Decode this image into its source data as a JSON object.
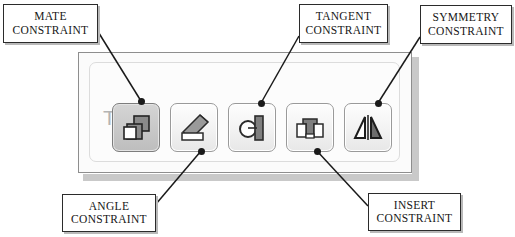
{
  "figure": {
    "title_hidden": "",
    "annotation_boxes": [
      {
        "id": "mate",
        "line1": "MATE",
        "line2": "CONSTRAINT"
      },
      {
        "id": "tangent",
        "line1": "TANGENT",
        "line2": "CONSTRAINT"
      },
      {
        "id": "symmetry",
        "line1": "SYMMETRY",
        "line2": "CONSTRAINT"
      },
      {
        "id": "angle",
        "line1": "ANGLE",
        "line2": "CONSTRAINT"
      },
      {
        "id": "insert",
        "line1": "INSERT",
        "line2": "CONSTRAINT"
      }
    ]
  },
  "panel": {
    "group_title": "Type",
    "buttons": [
      {
        "icon": "mate-constraint-icon",
        "label": "Mate",
        "selected": true
      },
      {
        "icon": "angle-constraint-icon",
        "label": "Angle",
        "selected": false
      },
      {
        "icon": "tangent-constraint-icon",
        "label": "Tangent",
        "selected": false
      },
      {
        "icon": "insert-constraint-icon",
        "label": "Insert",
        "selected": false
      },
      {
        "icon": "symmetry-constraint-icon",
        "label": "Symmetry",
        "selected": false
      }
    ]
  },
  "colors": {
    "panel_background": "#fbfbfb",
    "panel_border": "#8e8e8e",
    "group_border": "#dcdcdc",
    "group_title": "#b4b4b4",
    "button_face": "#f3f3f3",
    "button_selected_face": "#c9c9c9",
    "button_border": "#9a9a9a",
    "callout_border": "#2b2b2b",
    "callout_shadow": "#b9b9b9",
    "leader_line": "#1a1a1a",
    "icon_dark": "#6f6f6f",
    "icon_outline": "#2b2b2b",
    "panel_shadow": "#c9c9c9"
  }
}
